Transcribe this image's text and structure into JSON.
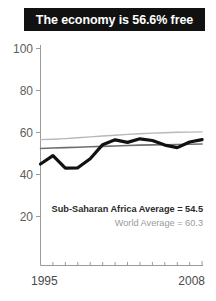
{
  "title": {
    "text": "The economy is 56.6% free"
  },
  "annotations": {
    "region_average": "Sub-Saharan Africa Average = 54.5",
    "world_average": "World Average = 60.3"
  },
  "colors": {
    "banner_background": "#111111",
    "banner_text": "#ffffff",
    "series_main": "#111111",
    "series_region_average": "#6e6e6e",
    "series_world_average": "#b8b8b8",
    "axis": "#9b9b9b",
    "tick_label": "#5e5e5e",
    "annotation_main": "#2b2b2b",
    "annotation_sub": "#9a9a9a"
  },
  "chart_data": {
    "type": "line",
    "title": "The economy is 56.6% free",
    "xlabel": "",
    "ylabel": "",
    "xlim": [
      1995,
      2008
    ],
    "ylim": [
      0,
      100
    ],
    "yticks": [
      20,
      40,
      60,
      80,
      100
    ],
    "ytick_labels": [
      "20",
      "40",
      "60",
      "80",
      "100"
    ],
    "xticks": [
      1995,
      1996,
      1997,
      1998,
      1999,
      2000,
      2001,
      2002,
      2003,
      2004,
      2005,
      2006,
      2007,
      2008
    ],
    "xtick_labels_shown": [
      "1995",
      "2008"
    ],
    "grid": false,
    "legend": "none",
    "x": [
      1995,
      1996,
      1997,
      1998,
      1999,
      2000,
      2001,
      2002,
      2003,
      2004,
      2005,
      2006,
      2007,
      2008
    ],
    "series": [
      {
        "name": "Economic freedom score",
        "style": "thick-black",
        "values": [
          45.0,
          49.0,
          43.0,
          43.2,
          47.5,
          54.2,
          56.5,
          55.3,
          57.0,
          56.2,
          54.0,
          52.8,
          55.5,
          56.6
        ]
      },
      {
        "name": "Sub-Saharan Africa Average",
        "style": "thin-dark-gray",
        "values": [
          52.4,
          52.6,
          52.8,
          53.0,
          53.2,
          53.4,
          53.6,
          53.8,
          54.0,
          54.1,
          54.2,
          54.3,
          54.4,
          54.5
        ]
      },
      {
        "name": "World Average",
        "style": "thin-light-gray",
        "values": [
          56.6,
          56.8,
          57.1,
          57.5,
          57.9,
          58.3,
          58.7,
          59.1,
          59.4,
          59.7,
          59.9,
          60.1,
          60.2,
          60.3
        ]
      }
    ]
  }
}
